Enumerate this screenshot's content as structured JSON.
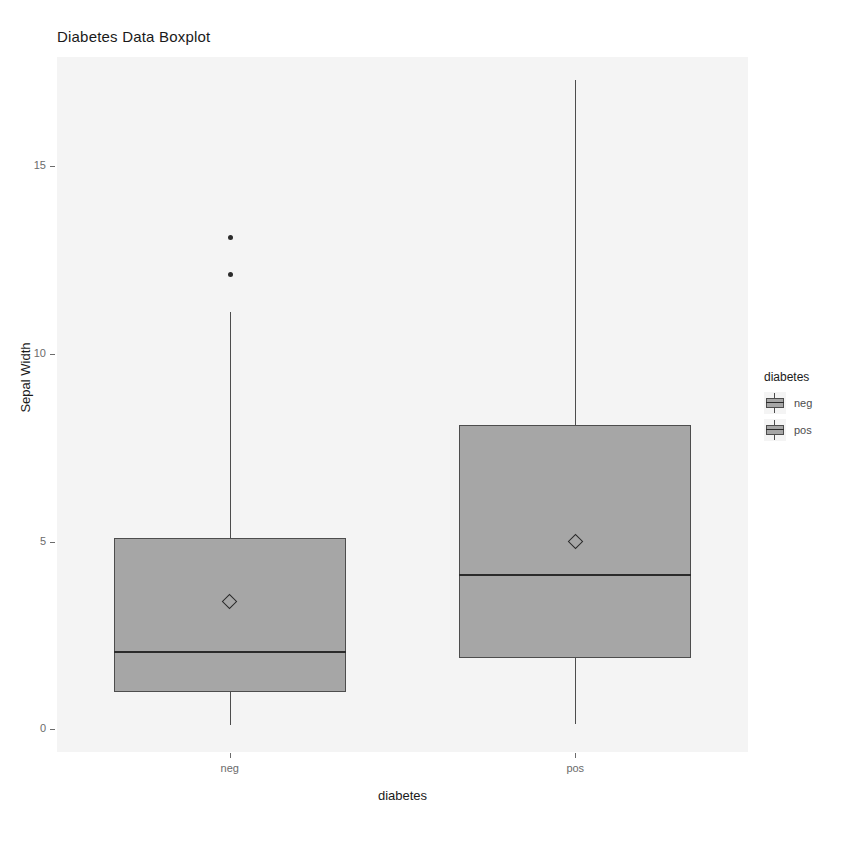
{
  "chart_data": {
    "type": "box",
    "title": "Diabetes Data Boxplot",
    "xlabel": "diabetes",
    "ylabel": "Sepal Width",
    "categories": [
      "neg",
      "pos"
    ],
    "ylim": [
      -0.6,
      17.9
    ],
    "yticks": [
      0,
      5,
      10,
      15
    ],
    "ytick_labels": [
      "0",
      "5",
      "10",
      "15"
    ],
    "grid": false,
    "legend": {
      "title": "diabetes",
      "position": "right",
      "entries": [
        {
          "label": "neg",
          "color": "#a6a6a6"
        },
        {
          "label": "pos",
          "color": "#a6a6a6"
        }
      ]
    },
    "boxes": [
      {
        "name": "neg",
        "lower_whisker": 0.13,
        "q1": 1.0,
        "median": 2.05,
        "q3": 5.1,
        "upper_whisker": 11.1,
        "mean": 3.4,
        "outliers": [
          12.1,
          13.1
        ],
        "fill": "#a6a6a6",
        "outline": "#4d4d4d"
      },
      {
        "name": "pos",
        "lower_whisker": 0.15,
        "q1": 1.9,
        "median": 4.1,
        "q3": 8.1,
        "upper_whisker": 17.3,
        "mean": 5.0,
        "outliers": [],
        "fill": "#a6a6a6",
        "outline": "#4d4d4d"
      }
    ]
  },
  "colors": {
    "panel_background": "#f4f4f4",
    "box_fill": "#a6a6a6",
    "box_outline": "#4d4d4d",
    "median": "#2b2b2b",
    "text": "#1a1a1a",
    "tick_text": "#6b6b6b"
  }
}
